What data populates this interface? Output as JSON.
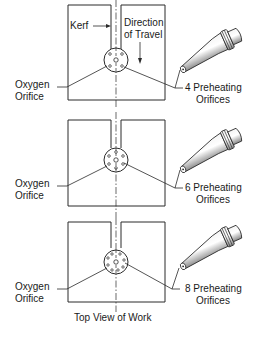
{
  "diagram": {
    "caption": "Top View of Work",
    "top_labels": {
      "kerf": "Kerf",
      "direction_line1": "Direction",
      "direction_line2": "of Travel"
    },
    "panels": [
      {
        "left_line1": "Oxygen",
        "left_line2": "Orifice",
        "right_line1": "4 Preheating",
        "right_line2": "Orifices",
        "preheat_count": 4
      },
      {
        "left_line1": "Oxygen",
        "left_line2": "Orifice",
        "right_line1": "6 Preheating",
        "right_line2": "Orifices",
        "preheat_count": 6
      },
      {
        "left_line1": "Oxygen",
        "left_line2": "Orifice",
        "right_line1": "8 Preheating",
        "right_line2": "Orifices",
        "preheat_count": 8
      }
    ],
    "colors": {
      "line": "#2a2a2a",
      "background": "#ffffff"
    }
  }
}
